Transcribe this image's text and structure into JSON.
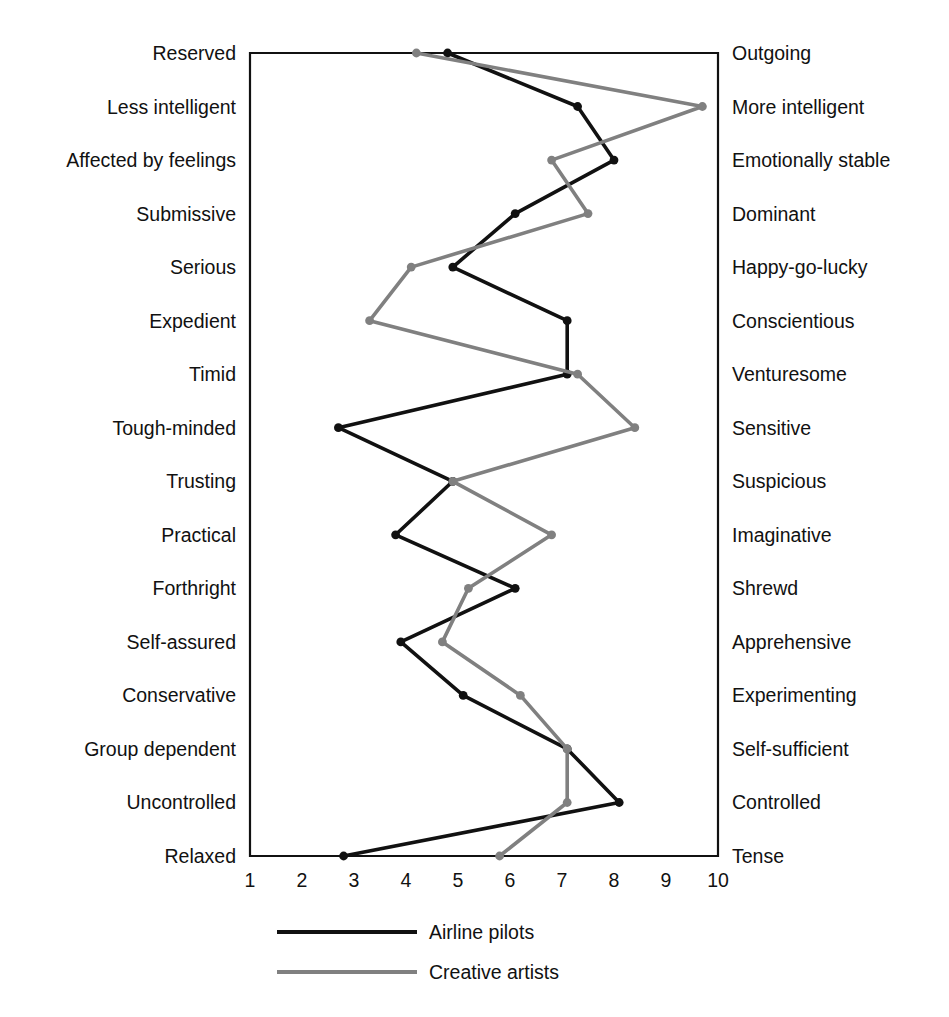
{
  "chart_data": {
    "type": "line",
    "title": "",
    "orientation": "horizontal-profile",
    "xlabel": "",
    "ylabel": "",
    "xlim": [
      1,
      10
    ],
    "xticks": [
      "1",
      "2",
      "3",
      "4",
      "5",
      "6",
      "7",
      "8",
      "9",
      "10"
    ],
    "grid": false,
    "legend_position": "bottom",
    "categories_left": [
      "Reserved",
      "Less intelligent",
      "Affected by feelings",
      "Submissive",
      "Serious",
      "Expedient",
      "Timid",
      "Tough-minded",
      "Trusting",
      "Practical",
      "Forthright",
      "Self-assured",
      "Conservative",
      "Group dependent",
      "Uncontrolled",
      "Relaxed"
    ],
    "categories_right": [
      "Outgoing",
      "More intelligent",
      "Emotionally stable",
      "Dominant",
      "Happy-go-lucky",
      "Conscientious",
      "Venturesome",
      "Sensitive",
      "Suspicious",
      "Imaginative",
      "Shrewd",
      "Apprehensive",
      "Experimenting",
      "Self-sufficient",
      "Controlled",
      "Tense"
    ],
    "series": [
      {
        "name": "Airline pilots",
        "color": "#111111",
        "values": [
          4.8,
          7.3,
          8.0,
          6.1,
          4.9,
          7.1,
          7.1,
          2.7,
          4.9,
          3.8,
          6.1,
          3.9,
          5.1,
          7.1,
          8.1,
          2.8
        ]
      },
      {
        "name": "Creative artists",
        "color": "#808080",
        "values": [
          4.2,
          9.7,
          6.8,
          7.5,
          4.1,
          3.3,
          7.3,
          8.4,
          4.9,
          6.8,
          5.2,
          4.7,
          6.2,
          7.1,
          7.1,
          5.8
        ]
      }
    ]
  },
  "legend": {
    "items": [
      {
        "label": "Airline pilots",
        "color": "#111111"
      },
      {
        "label": "Creative artists",
        "color": "#808080"
      }
    ]
  },
  "colors": {
    "pilots": "#111111",
    "artists": "#808080",
    "axis": "#111111",
    "background": "#ffffff"
  }
}
